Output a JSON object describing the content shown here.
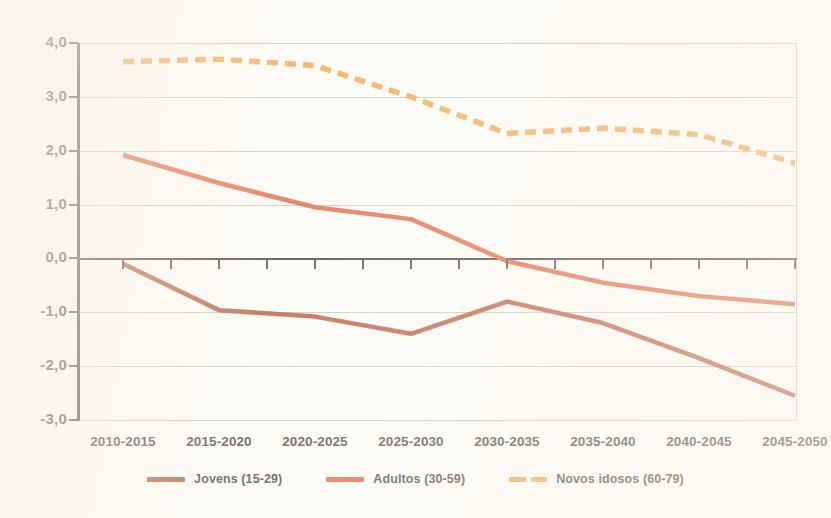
{
  "chart_data": {
    "type": "line",
    "title": "",
    "xlabel": "",
    "ylabel": "",
    "categories": [
      "2010-2015",
      "2015-2020",
      "2020-2025",
      "2025-2030",
      "2030-2035",
      "2035-2040",
      "2040-2045",
      "2045-2050"
    ],
    "yticks": [
      "4,0",
      "3,0",
      "2,0",
      "1,0",
      "0,0",
      "-1,0",
      "-2,0",
      "-3,0"
    ],
    "ytick_values": [
      4.0,
      3.0,
      2.0,
      1.0,
      0.0,
      -1.0,
      -2.0,
      -3.0
    ],
    "ylim": [
      -3.0,
      4.0
    ],
    "grid": true,
    "legend_position": "bottom",
    "series": [
      {
        "name": "Jovens (15-29)",
        "color": "#b5553a",
        "style": "solid",
        "values": [
          -0.1,
          -0.96,
          -1.08,
          -1.4,
          -0.8,
          -1.2,
          -1.85,
          -2.55
        ]
      },
      {
        "name": "Adultos (30-59)",
        "color": "#e0603a",
        "style": "solid",
        "values": [
          1.92,
          1.4,
          0.95,
          0.73,
          -0.05,
          -0.45,
          -0.7,
          -0.85
        ]
      },
      {
        "name": "Novos idosos (60-79)",
        "color": "#f0a24a",
        "style": "dashed",
        "values": [
          3.65,
          3.7,
          3.58,
          3.0,
          2.32,
          2.42,
          2.3,
          1.77
        ]
      }
    ]
  },
  "legend": {
    "items": [
      {
        "label": "Jovens (15-29)",
        "color": "#b5553a",
        "style": "solid"
      },
      {
        "label": "Adultos (30-59)",
        "color": "#e0603a",
        "style": "solid"
      },
      {
        "label": "Novos idosos (60-79)",
        "color": "#f0a24a",
        "style": "dashed"
      }
    ]
  },
  "axis": {
    "y_labels": [
      "4,0",
      "3,0",
      "2,0",
      "1,0",
      "0,0",
      "-1,0",
      "-2,0",
      "-3,0"
    ],
    "x_labels": [
      "2010-2015",
      "2015-2020",
      "2020-2025",
      "2025-2030",
      "2030-2035",
      "2035-2040",
      "2040-2045",
      "2045-2050"
    ]
  }
}
